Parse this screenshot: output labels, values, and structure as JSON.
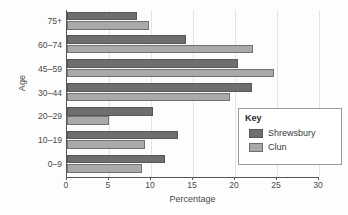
{
  "chart_data": {
    "type": "bar",
    "orientation": "horizontal",
    "title": "",
    "xlabel": "Percentage",
    "ylabel": "Age",
    "categories": [
      "0–9",
      "10–19",
      "20–29",
      "30–44",
      "45–59",
      "60–74",
      "75+"
    ],
    "series": [
      {
        "name": "Shrewsbury",
        "color": "#6e6e6e",
        "values": [
          11.7,
          13.2,
          10.2,
          22.0,
          20.4,
          14.2,
          8.3
        ]
      },
      {
        "name": "Clun",
        "color": "#a9a9a9",
        "values": [
          8.9,
          9.3,
          5.0,
          19.4,
          24.6,
          22.1,
          9.8
        ]
      }
    ],
    "xlim": [
      0,
      30
    ],
    "xticks": [
      0,
      5,
      10,
      15,
      20,
      25,
      30
    ],
    "xtick_labels": [
      "0",
      "5",
      "10",
      "15",
      "20",
      "25",
      "30"
    ],
    "grid": true,
    "grid_axis": "x",
    "legend": {
      "title": "Key",
      "position": "center-right",
      "entries": [
        "Shrewsbury",
        "Clun"
      ]
    }
  },
  "legend": {
    "title": "Key",
    "items": [
      {
        "label": "Shrewsbury",
        "color": "#6e6e6e"
      },
      {
        "label": "Clun",
        "color": "#a9a9a9"
      }
    ]
  },
  "axes": {
    "x_title": "Percentage",
    "y_title": "Age"
  }
}
